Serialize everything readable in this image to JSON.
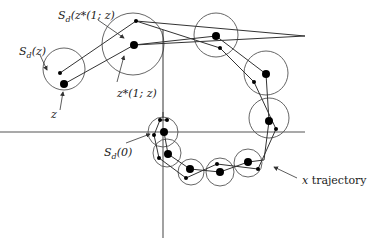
{
  "diagram": {
    "axes": {
      "horizontal": {
        "x1": 0,
        "x2": 305,
        "y": 132
      },
      "vertical": {
        "x": 163,
        "y1": 112,
        "y2": 238
      },
      "color": "#555555"
    },
    "circles": [
      {
        "cx": 64,
        "cy": 69,
        "r": 21,
        "center": [
          64,
          84
        ],
        "dot": [
          64,
          84
        ],
        "small": [
          60,
          73
        ]
      },
      {
        "cx": 133,
        "cy": 44,
        "r": 31,
        "center": [
          134,
          45
        ],
        "small": [
          136,
          21
        ]
      },
      {
        "cx": 216,
        "cy": 35,
        "r": 22,
        "center": [
          216,
          36
        ],
        "small": [
          220,
          48
        ]
      },
      {
        "cx": 266,
        "cy": 73,
        "r": 22,
        "center": [
          266,
          74
        ],
        "small": [
          254,
          82
        ]
      },
      {
        "cx": 269,
        "cy": 118,
        "r": 20,
        "center": [
          269,
          121
        ],
        "small": [
          276,
          129
        ]
      },
      {
        "cx": 163,
        "cy": 132,
        "r": 15,
        "center": [
          164,
          132
        ],
        "small": [
          160,
          120
        ],
        "small2": [
          167,
          120
        ],
        "small3": [
          154,
          135
        ]
      },
      {
        "cx": 167,
        "cy": 153,
        "r": 14,
        "center": [
          168,
          154
        ],
        "small": [
          159,
          158
        ]
      },
      {
        "cx": 191,
        "cy": 172,
        "r": 13,
        "center": [
          190,
          169
        ],
        "small": [
          186,
          178
        ]
      },
      {
        "cx": 220,
        "cy": 172,
        "r": 14,
        "center": [
          220,
          172
        ],
        "small": [
          217,
          164
        ]
      },
      {
        "cx": 248,
        "cy": 163,
        "r": 14,
        "center": [
          248,
          162
        ],
        "small": [
          258,
          169
        ]
      }
    ],
    "center_path": [
      [
        64,
        84
      ],
      [
        134,
        45
      ],
      [
        216,
        36
      ],
      [
        266,
        74
      ],
      [
        269,
        121
      ],
      [
        264,
        160
      ],
      [
        248,
        162
      ],
      [
        220,
        172
      ],
      [
        190,
        169
      ],
      [
        168,
        154
      ],
      [
        164,
        132
      ]
    ],
    "z_star_path": [
      [
        60,
        73
      ],
      [
        136,
        21
      ],
      [
        305,
        36
      ]
    ],
    "x_path": [
      [
        60,
        73
      ],
      [
        136,
        21
      ],
      [
        220,
        48
      ],
      [
        254,
        82
      ],
      [
        276,
        129
      ],
      [
        258,
        169
      ],
      [
        217,
        164
      ],
      [
        186,
        178
      ],
      [
        159,
        158
      ],
      [
        154,
        135
      ],
      [
        160,
        120
      ],
      [
        167,
        120
      ]
    ],
    "labels": {
      "s_z_star": {
        "main": "S",
        "sub": "d",
        "rest": "(z*(1; z)"
      },
      "s_z": {
        "main": "S",
        "sub": "d",
        "rest": "(z)"
      },
      "z_star": "z*(1; z)",
      "z": "z",
      "s_zero": {
        "main": "S",
        "sub": "d",
        "rest": "(0)"
      },
      "x_traj": {
        "var": "x",
        "rest": " trajectory"
      }
    },
    "arrows": [
      {
        "from": [
          98,
          20
        ],
        "to": [
          124,
          38
        ]
      },
      {
        "from": [
          40,
          55
        ],
        "to": [
          47,
          70
        ]
      },
      {
        "from": [
          117,
          82
        ],
        "to": [
          124,
          56
        ]
      },
      {
        "from": [
          60,
          110
        ],
        "to": [
          63,
          92
        ]
      },
      {
        "from": [
          126,
          143
        ],
        "to": [
          150,
          134
        ]
      },
      {
        "from": [
          297,
          178
        ],
        "to": [
          274,
          167
        ]
      }
    ],
    "stroke_color": "#333333",
    "dot_color": "#000000"
  }
}
